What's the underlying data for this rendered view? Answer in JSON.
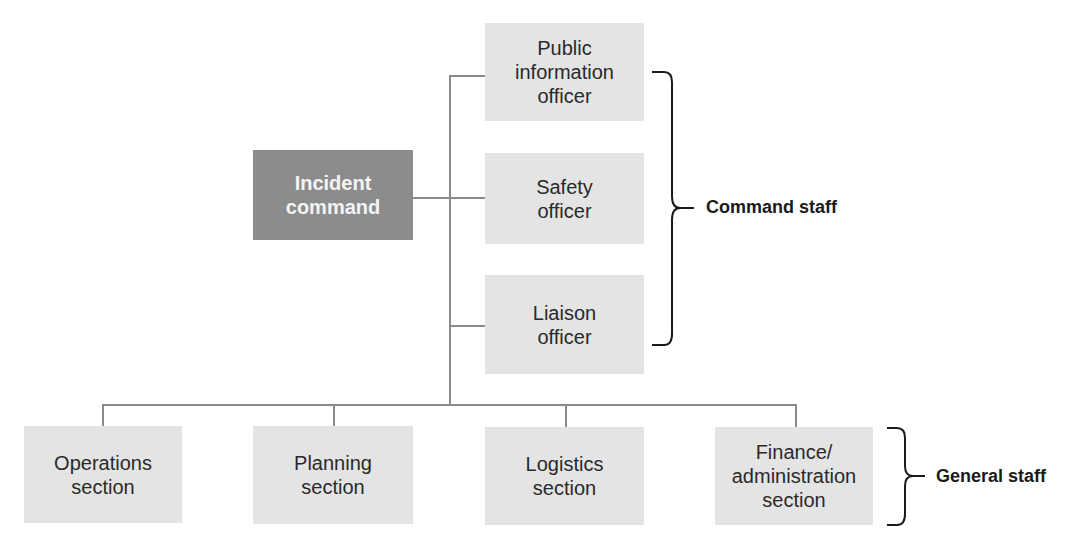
{
  "diagram": {
    "root": {
      "label": "Incident\ncommand"
    },
    "command_staff": [
      {
        "label": "Public\ninformation\nofficer"
      },
      {
        "label": "Safety\nofficer"
      },
      {
        "label": "Liaison\nofficer"
      }
    ],
    "general_staff": [
      {
        "label": "Operations\nsection"
      },
      {
        "label": "Planning\nsection"
      },
      {
        "label": "Logistics\nsection"
      },
      {
        "label": "Finance/\nadministration\nsection"
      }
    ],
    "groups": {
      "command_staff_label": "Command staff",
      "general_staff_label": "General staff"
    },
    "colors": {
      "root_fill": "#8c8c8c",
      "node_fill": "#e4e4e4",
      "connector": "#8a8a8a"
    }
  }
}
